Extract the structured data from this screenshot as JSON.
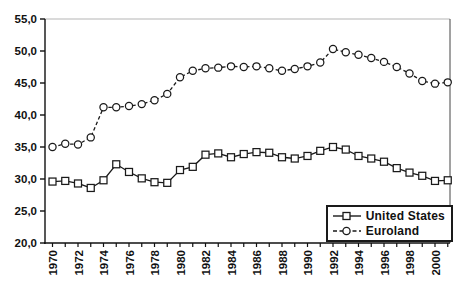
{
  "window": {
    "background": "#ffffff"
  },
  "chart_data": {
    "type": "line",
    "title": "",
    "xlabel": "",
    "ylabel": "",
    "x": [
      1970,
      1971,
      1972,
      1973,
      1974,
      1975,
      1976,
      1977,
      1978,
      1979,
      1980,
      1981,
      1982,
      1983,
      1984,
      1985,
      1986,
      1987,
      1988,
      1989,
      1990,
      1991,
      1992,
      1993,
      1994,
      1995,
      1996,
      1997,
      1998,
      1999,
      2000,
      2001
    ],
    "series": [
      {
        "name": "United States",
        "marker": "square",
        "line_style": "solid",
        "color": "#1a1a1a",
        "values": [
          29.6,
          29.7,
          29.3,
          28.6,
          29.8,
          32.3,
          31.1,
          30.1,
          29.5,
          29.4,
          31.4,
          31.9,
          33.8,
          34.0,
          33.4,
          33.9,
          34.2,
          34.1,
          33.4,
          33.2,
          33.6,
          34.4,
          35.0,
          34.6,
          33.6,
          33.2,
          32.7,
          31.7,
          31.0,
          30.5,
          29.7,
          29.8
        ]
      },
      {
        "name": "Euroland",
        "marker": "circle",
        "line_style": "dashed",
        "color": "#1a1a1a",
        "values": [
          35.0,
          35.5,
          35.4,
          36.5,
          41.2,
          41.2,
          41.4,
          41.7,
          42.3,
          43.3,
          45.9,
          46.9,
          47.3,
          47.4,
          47.6,
          47.5,
          47.6,
          47.3,
          46.9,
          47.2,
          47.6,
          48.2,
          50.3,
          49.8,
          49.4,
          48.9,
          48.3,
          47.5,
          46.5,
          45.3,
          44.9,
          45.1
        ]
      }
    ],
    "ylim": [
      20,
      55
    ],
    "ytick_step": 5,
    "ytick_labels": [
      "20,0",
      "25,0",
      "30,0",
      "35,0",
      "40,0",
      "45,0",
      "50,0",
      "55,0"
    ],
    "xtick_labels": [
      "1970",
      "1972",
      "1974",
      "1976",
      "1978",
      "1980",
      "1982",
      "1984",
      "1986",
      "1988",
      "1990",
      "1992",
      "1994",
      "1996",
      "1998",
      "2000"
    ],
    "grid": "top-border-only",
    "legend_position": "bottom-right",
    "axis_color": "#111111",
    "top_border_color": "#b5b5b5",
    "marker_fill": "#ffffff"
  },
  "legend": {
    "items": [
      {
        "label": "United States",
        "marker": "square"
      },
      {
        "label": "Euroland",
        "marker": "circle"
      }
    ]
  }
}
